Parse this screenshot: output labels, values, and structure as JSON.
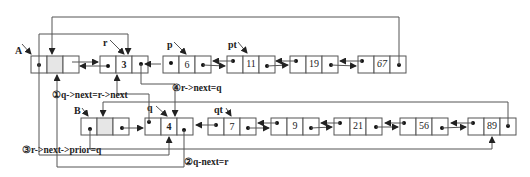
{
  "diagram": {
    "type": "doubly-linked-list-merge-insertion",
    "colors": {
      "stroke": "#555555",
      "dot": "#111111",
      "shaded": "#e6e6e6",
      "text": "#222222"
    },
    "list_a": {
      "head_label": "A",
      "nodes": [
        {
          "value": "",
          "head": true
        },
        {
          "value": "3",
          "pointer": "r"
        },
        {
          "value": "6",
          "pointer": "p"
        },
        {
          "value": "11",
          "pointer": "pt"
        },
        {
          "value": "19"
        },
        {
          "value": "67"
        }
      ]
    },
    "list_b": {
      "head_label": "B",
      "nodes": [
        {
          "value": "",
          "head": true
        },
        {
          "value": "4",
          "pointer": "q"
        },
        {
          "value": "7",
          "pointer": "qt"
        },
        {
          "value": "9"
        },
        {
          "value": "21"
        },
        {
          "value": "56"
        },
        {
          "value": "89"
        }
      ]
    },
    "pointers": {
      "A": "A",
      "B": "B",
      "r": "r",
      "p": "p",
      "pt": "pt",
      "q": "q",
      "qt": "qt"
    },
    "steps": [
      {
        "id": 1,
        "marker": "①",
        "text": "q->next=r->next"
      },
      {
        "id": 2,
        "marker": "②",
        "text": "q-next=r"
      },
      {
        "id": 3,
        "marker": "③",
        "text": "r->next->prior=q"
      },
      {
        "id": 4,
        "marker": "④",
        "text": "r->next=q"
      }
    ],
    "step_labels": {
      "s1": "①q->next=r->next",
      "s2": "②q-next=r",
      "s3": "③r->next->prior=q",
      "s4": "④r->next=q"
    },
    "values": {
      "a1": "3",
      "a2": "6",
      "a3": "11",
      "a4": "19",
      "a5": "67",
      "b1": "4",
      "b2": "7",
      "b3": "9",
      "b4": "21",
      "b5": "56",
      "b6": "89"
    }
  }
}
